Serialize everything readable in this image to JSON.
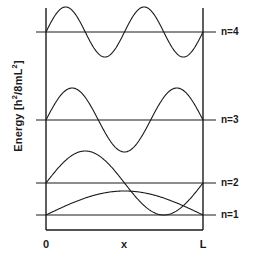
{
  "figure": {
    "title": "",
    "axis": {
      "ylabel_text": "Energy  [h",
      "ylabel_sup1": "2",
      "ylabel_mid": "/8mL",
      "ylabel_sup2": "2",
      "ylabel_end": "]",
      "ylabel_full": "Energy [h2/8mL2]",
      "xticks": [
        "0",
        "x",
        "L"
      ],
      "xlabel": "x",
      "x_origin_label": "0",
      "x_end_label": "L"
    },
    "levels": [
      {
        "label": "n=1"
      },
      {
        "label": "n=2"
      },
      {
        "label": "n=3"
      },
      {
        "label": "n=4"
      }
    ],
    "colors": {
      "line": "#1a1a1a",
      "wave": "#1a1a1a",
      "text": "#1a1a1a",
      "background": "#ffffff"
    }
  },
  "chart_data": {
    "type": "line",
    "xlabel": "x",
    "ylabel": "Energy [h2/8mL2]",
    "xlim": [
      0,
      1
    ],
    "ylim": [
      0,
      17
    ],
    "xtick_labels": [
      "0",
      "x",
      "L"
    ],
    "xtick_values": [
      0,
      0.5,
      1
    ],
    "grid": false,
    "legend": "right-of-axes",
    "series": [
      {
        "name": "n=1",
        "quantum_number": 1,
        "energy": 1,
        "energy_units": "h2/8mL2",
        "nodes": 0,
        "half_wavelengths": 1,
        "formula": "psi(x) = A sin(1*pi*x/L)",
        "baseline_y_px": 215,
        "amplitude_px": 24,
        "label_text": "n=1"
      },
      {
        "name": "n=2",
        "quantum_number": 2,
        "energy": 4,
        "energy_units": "h2/8mL2",
        "nodes": 1,
        "half_wavelengths": 2,
        "formula": "psi(x) = A sin(2*pi*x/L)",
        "baseline_y_px": 183,
        "amplitude_px": 32,
        "label_text": "n=2"
      },
      {
        "name": "n=3",
        "quantum_number": 3,
        "energy": 9,
        "energy_units": "h2/8mL2",
        "nodes": 2,
        "half_wavelengths": 3,
        "formula": "psi(x) = A sin(3*pi*x/L)",
        "baseline_y_px": 120,
        "amplitude_px": 32,
        "label_text": "n=3"
      },
      {
        "name": "n=4",
        "quantum_number": 4,
        "energy": 16,
        "energy_units": "h2/8mL2",
        "nodes": 3,
        "half_wavelengths": 4,
        "formula": "psi(x) = A sin(4*pi*x/L)",
        "baseline_y_px": 32,
        "amplitude_px": 25,
        "label_text": "n=4"
      }
    ],
    "box": {
      "left_wall_x_px": 46,
      "right_wall_x_px": 203,
      "floor_y_px": 230,
      "top_y_px": 8
    }
  }
}
